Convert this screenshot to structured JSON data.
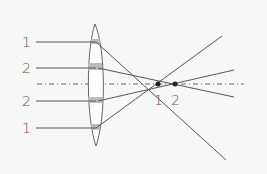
{
  "diagram": {
    "type": "lens-spherical-aberration",
    "left_labels": [
      {
        "text": "1",
        "y": 42
      },
      {
        "text": "2",
        "y": 68
      },
      {
        "text": "2",
        "y": 101
      },
      {
        "text": "1",
        "y": 128
      }
    ],
    "focal_labels": [
      {
        "text": "1",
        "x": 158
      },
      {
        "text": "2",
        "x": 175
      }
    ],
    "colors": {
      "line": "#555555",
      "lens_fill": "#ffffff",
      "lens_band": "#b8b8b8",
      "background": "#f7f7f7"
    }
  }
}
